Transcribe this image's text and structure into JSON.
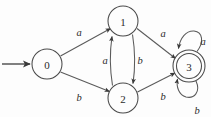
{
  "figure": {
    "type": "state-transition-diagram",
    "background_color": "#fdfdfd",
    "stroke_color": "#4a4a4a",
    "text_color": "#2b2b2b"
  },
  "states": [
    {
      "id": "0",
      "label": "0",
      "cx": 47,
      "cy": 64,
      "r": 15,
      "accepting": false,
      "start": true
    },
    {
      "id": "1",
      "label": "1",
      "cx": 123,
      "cy": 21,
      "r": 15,
      "accepting": false,
      "start": false
    },
    {
      "id": "2",
      "label": "2",
      "cx": 123,
      "cy": 98,
      "r": 15,
      "accepting": false,
      "start": false
    },
    {
      "id": "3",
      "label": "3",
      "cx": 189,
      "cy": 66,
      "r": 16,
      "r_inner": 12.5,
      "accepting": true,
      "start": false
    }
  ],
  "transitions": [
    {
      "from": "0",
      "to": "1",
      "symbol": "a",
      "label_x": 79,
      "label_y": 32
    },
    {
      "from": "0",
      "to": "2",
      "symbol": "b",
      "label_x": 79,
      "label_y": 97
    },
    {
      "from": "2",
      "to": "1",
      "symbol": "a",
      "label_x": 105,
      "label_y": 60
    },
    {
      "from": "1",
      "to": "2",
      "symbol": "b",
      "label_x": 140,
      "label_y": 60
    },
    {
      "from": "1",
      "to": "3",
      "symbol": "a",
      "label_x": 163,
      "label_y": 33
    },
    {
      "from": "2",
      "to": "3",
      "symbol": "b",
      "label_x": 163,
      "label_y": 96
    },
    {
      "from": "3",
      "to": "3",
      "symbol": "a",
      "label_x": 203,
      "label_y": 41
    },
    {
      "from": "3",
      "to": "3",
      "symbol": "b",
      "label_x": 197,
      "label_y": 110
    }
  ],
  "start_marker": {
    "name": "start-arrow",
    "x1": 2,
    "y1": 64,
    "x2": 31,
    "y2": 64
  }
}
